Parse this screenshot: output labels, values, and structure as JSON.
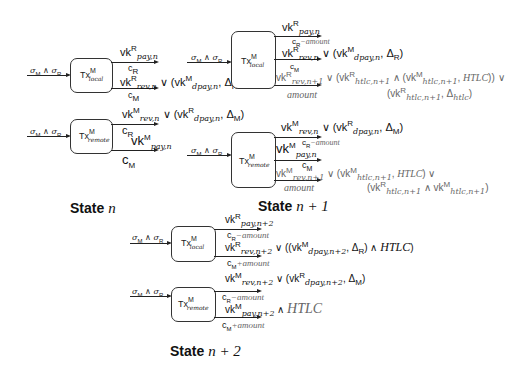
{
  "diagram": {
    "input_label": "σM ∧ σR",
    "states": [
      {
        "title_prefix": "State",
        "title_var": "n",
        "local": {
          "box_label": "Tx local M",
          "outputs": [
            {
              "key": "vk^R_{pay,n}",
              "amount": "c_R"
            },
            {
              "key": "vk^R_{rev,n} ∨ (vk^M_{dpay,n}, Δ_R)",
              "amount": "c_M"
            }
          ]
        },
        "remote": {
          "box_label": "Tx remote M",
          "outputs": [
            {
              "key": "vk^M_{rev,n} ∨ (vk^R_{dpay,n}, Δ_M)",
              "amount": "c_R"
            },
            {
              "key": "vk^M_{pay,n}",
              "amount": "c_M"
            }
          ]
        }
      },
      {
        "title_prefix": "State",
        "title_var": "n + 1",
        "local": {
          "box_label": "Tx local M",
          "outputs": [
            {
              "key": "vk^R_{pay,n}",
              "amount": "c_R − amount"
            },
            {
              "key": "vk^R_{rev,n} ∨ (vk^M_{dpay,n}, Δ_R)",
              "amount": "c_M"
            },
            {
              "key": "vk^R_{rev,n+1} ∨ (vk^R_{htlc,n+1} ∧ (vk^M_{htlc,n+1}, HTLC)) ∨ (vk^R_{htlc,n+1}, Δ_htlc)",
              "amount": "amount"
            }
          ]
        },
        "remote": {
          "box_label": "Tx remote M",
          "outputs": [
            {
              "key": "vk^M_{rev,n} ∨ (vk^R_{dpay,n}, Δ_M)",
              "amount": "c_R − amount"
            },
            {
              "key": "vk^M_{pay,n}",
              "amount": "c_M"
            },
            {
              "key": "vk^M_{rev,n+1} ∨ (vk^M_{htlc,n+1}, HTLC) ∨ (vk^R_{htlc,n+1} ∧ vk^M_{htlc,n+1})",
              "amount": "amount"
            }
          ]
        }
      },
      {
        "title_prefix": "State",
        "title_var": "n + 2",
        "local": {
          "box_label": "Tx local M",
          "outputs": [
            {
              "key": "vk^R_{pay,n+2}",
              "amount": "c_R − amount"
            },
            {
              "key": "vk^R_{rev,n+2} ∨ ((vk^M_{dpay,n+2}, Δ_R) ∧ HTLC)",
              "amount": "c_M + amount"
            }
          ]
        },
        "remote": {
          "box_label": "Tx remote M",
          "outputs": [
            {
              "key": "vk^M_{rev,n+2} ∨ (vk^R_{dpay,n+2}, Δ_M)",
              "amount": "c_R − amount"
            },
            {
              "key": "vk^M_{pay,n+2} ∧ HTLC",
              "amount": "c_M + amount"
            }
          ]
        }
      }
    ]
  },
  "text": {
    "sigma": "σ",
    "M": "M",
    "R": "R",
    "and": " ∧ ",
    "or": " ∨ ",
    "Tx": "Tx",
    "local": "local",
    "remote": "remote",
    "vk": "vk",
    "pay_n": "pay,n",
    "rev_n": "rev,n",
    "dpay_n": "dpay,n",
    "rev_n1": "rev,n+1",
    "htlc_n1": "htlc,n+1",
    "htlc": "htlc",
    "pay_n2": "pay,n+2",
    "rev_n2": "rev,n+2",
    "dpay_n2": "dpay,n+2",
    "delta": "Δ",
    "c": "c",
    "amount": "amount",
    "minus_amount": "−amount",
    "plus_amount": "+amount",
    "HTLC": "HTLC",
    "state": "State",
    "n": "n",
    "n1": "n + 1",
    "n2": "n + 2"
  }
}
